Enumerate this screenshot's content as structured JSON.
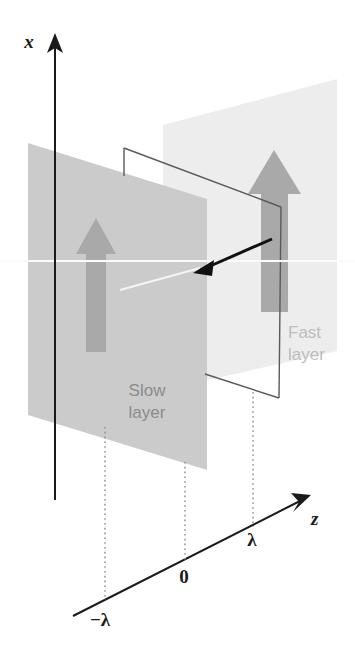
{
  "figure": {
    "background_color": "#ffffff"
  },
  "axes": {
    "vertical": {
      "label": "x",
      "color": "#1a1a1a",
      "name": "x-axis"
    },
    "depth": {
      "label": "z",
      "color": "#1a1a1a",
      "name": "z-axis"
    },
    "ticks": [
      {
        "label": "−λ",
        "value": "-lambda"
      },
      {
        "label": "0",
        "value": "0"
      },
      {
        "label": "λ",
        "value": "lambda"
      }
    ]
  },
  "layers": [
    {
      "name": "slow-layer",
      "label_line1": "Slow",
      "label_line2": "layer",
      "fill": "#c9c9c9",
      "label_color": "#8c8c8c"
    },
    {
      "name": "fast-layer",
      "label_line1": "Fast",
      "label_line2": "layer",
      "fill": "#ededed",
      "label_color": "#bdbdbd"
    }
  ],
  "arrows": {
    "polarization_color": "#a9a9a9",
    "ray_color": "#111111",
    "count_polarization": 2
  },
  "colors": {
    "outline": "#595959",
    "dotted_guide": "#8f8f8f",
    "axis": "#1a1a1a"
  }
}
